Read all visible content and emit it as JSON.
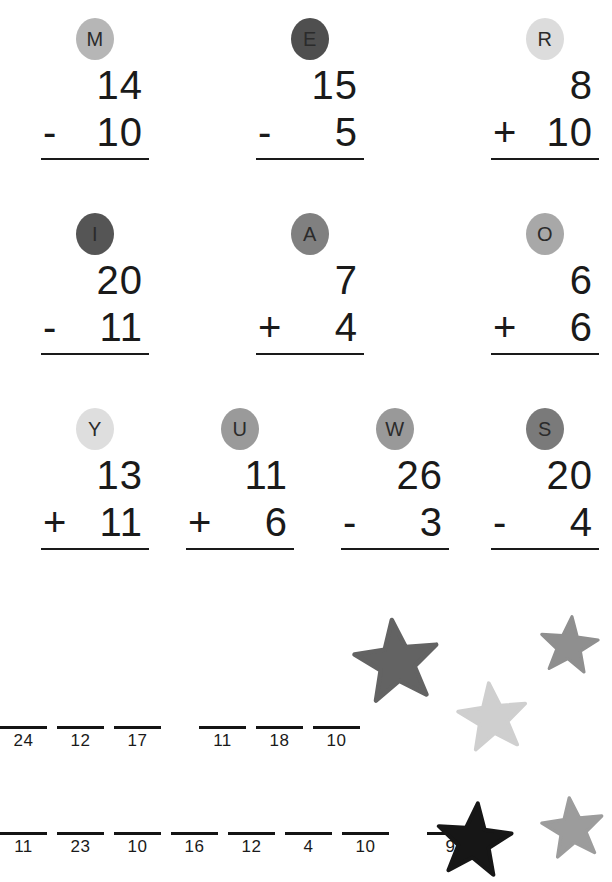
{
  "worksheet": {
    "background_color": "#ffffff",
    "ink_color": "#1a1a1a"
  },
  "problem_rows": [
    {
      "row_id": "row-1",
      "problems": [
        {
          "letter": "M",
          "badge_color": "#b6b6b6",
          "top_number": "14",
          "operator": "-",
          "bottom_number": "10",
          "left": 20
        },
        {
          "letter": "E",
          "badge_color": "#4f4f4f",
          "top_number": "15",
          "operator": "-",
          "bottom_number": "5",
          "left": 235
        },
        {
          "letter": "R",
          "badge_color": "#dcdcdc",
          "top_number": "8",
          "operator": "+",
          "bottom_number": "10",
          "left": 470
        }
      ]
    },
    {
      "row_id": "row-2",
      "problems": [
        {
          "letter": "I",
          "badge_color": "#555555",
          "top_number": "20",
          "operator": "-",
          "bottom_number": "11",
          "left": 20
        },
        {
          "letter": "A",
          "badge_color": "#808080",
          "top_number": "7",
          "operator": "+",
          "bottom_number": "4",
          "left": 235
        },
        {
          "letter": "O",
          "badge_color": "#a8a8a8",
          "top_number": "6",
          "operator": "+",
          "bottom_number": "6",
          "left": 470
        }
      ]
    },
    {
      "row_id": "row-3",
      "problems": [
        {
          "letter": "Y",
          "badge_color": "#dedede",
          "top_number": "13",
          "operator": "+",
          "bottom_number": "11",
          "left": 20
        },
        {
          "letter": "U",
          "badge_color": "#9a9a9a",
          "top_number": "11",
          "operator": "+",
          "bottom_number": "6",
          "left": 165
        },
        {
          "letter": "W",
          "badge_color": "#999999",
          "top_number": "26",
          "operator": "-",
          "bottom_number": "3",
          "left": 320
        },
        {
          "letter": "S",
          "badge_color": "#7a7a7a",
          "top_number": "20",
          "operator": "-",
          "bottom_number": "4",
          "left": 470
        }
      ]
    }
  ],
  "answer_rows": [
    {
      "row_id": "answer-row-1",
      "slots": [
        {
          "type": "blank",
          "value": "24"
        },
        {
          "type": "blank",
          "value": "12"
        },
        {
          "type": "blank",
          "value": "17"
        },
        {
          "type": "gap",
          "value": ""
        },
        {
          "type": "blank",
          "value": "11"
        },
        {
          "type": "blank",
          "value": "18"
        },
        {
          "type": "blank",
          "value": "10"
        }
      ]
    },
    {
      "row_id": "answer-row-2",
      "slots": [
        {
          "type": "blank",
          "value": "11"
        },
        {
          "type": "blank",
          "value": "23"
        },
        {
          "type": "blank",
          "value": "10"
        },
        {
          "type": "blank",
          "value": "16"
        },
        {
          "type": "blank",
          "value": "12"
        },
        {
          "type": "blank",
          "value": "4"
        },
        {
          "type": "blank",
          "value": "10"
        },
        {
          "type": "gap",
          "value": ""
        },
        {
          "type": "blank",
          "value": "9"
        }
      ]
    }
  ],
  "stars": [
    {
      "name": "star-large-dark-gray",
      "color": "#636363",
      "left": 352,
      "top": 616,
      "size": 90
    },
    {
      "name": "star-small-gray-top-right",
      "color": "#8f8f8f",
      "left": 538,
      "top": 614,
      "size": 62
    },
    {
      "name": "star-light-gray-middle",
      "color": "#cfcfcf",
      "left": 456,
      "top": 680,
      "size": 74
    },
    {
      "name": "star-black-bottom",
      "color": "#161616",
      "left": 434,
      "top": 800,
      "size": 80
    },
    {
      "name": "star-gray-bottom-right",
      "color": "#9c9c9c",
      "left": 540,
      "top": 795,
      "size": 66
    }
  ]
}
